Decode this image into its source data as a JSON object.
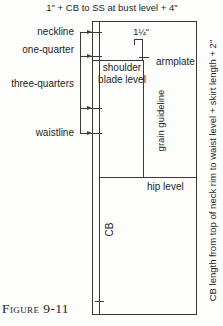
{
  "title": "1\" + CB to SS at bust level + 4\"",
  "right_caption": "CB length from top of neck rim to waist level + skirt length + 2\"",
  "left_labels": {
    "neckline": "neckline",
    "one_quarter": "one-quarter",
    "three_quarters": "three-quarters",
    "waistline": "waistline"
  },
  "inner_labels": {
    "measurement": "1¼\"",
    "shoulder_blade_level": "shoulder blade level",
    "armplate": "armplate",
    "grain_guideline": "grain guideline",
    "hip_level": "hip level",
    "center_back": "CB"
  },
  "figure_caption": "Figure 9-11",
  "colors": {
    "line": "#3a3a3a",
    "text": "#262626",
    "background": "#fdfdfb"
  }
}
